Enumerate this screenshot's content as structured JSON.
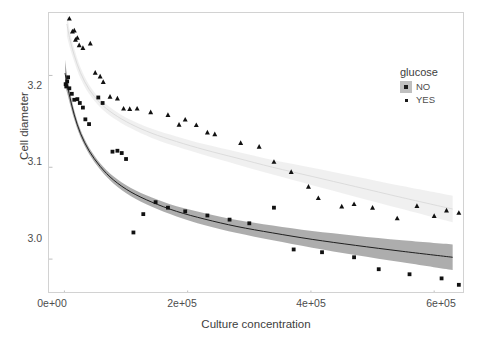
{
  "chart_data": {
    "type": "scatter",
    "title": "",
    "xlabel": "Culture concentration",
    "ylabel": "Cell diameter",
    "xlim": [
      -25000,
      650000
    ],
    "ylim": [
      2.962,
      3.268
    ],
    "xticks": [
      0,
      200000,
      400000,
      600000
    ],
    "xticklabels": [
      "0e+00",
      "2e+05",
      "4e+05",
      "6e+05"
    ],
    "yticks": [
      3.0,
      3.1,
      3.2
    ],
    "yticklabels": [
      "3.0",
      "3.1",
      "3.2"
    ],
    "grid": false,
    "legend": {
      "title": "glucose",
      "position": "right",
      "entries": [
        {
          "label": "NO",
          "marker": "square",
          "color": "#1a1a1a",
          "ribbon": "#a9a9a9"
        },
        {
          "label": "YES",
          "marker": "triangle",
          "color": "#1a1a1a",
          "ribbon": "#ededed"
        }
      ]
    },
    "series": [
      {
        "name": "NO",
        "marker": "square",
        "color": "#111111",
        "line_color": "#1f1f1f",
        "ribbon_color": "#a9a9a9",
        "points": [
          [
            2000,
            3.1905
          ],
          [
            3000,
            3.188
          ],
          [
            4500,
            3.1935
          ],
          [
            6000,
            3.198
          ],
          [
            8000,
            3.186
          ],
          [
            12000,
            3.18
          ],
          [
            16000,
            3.1735
          ],
          [
            21000,
            3.1742
          ],
          [
            25000,
            3.17
          ],
          [
            30000,
            3.165
          ],
          [
            34000,
            3.1522
          ],
          [
            40000,
            3.147
          ],
          [
            55000,
            3.176
          ],
          [
            62000,
            3.17
          ],
          [
            78000,
            3.117
          ],
          [
            86000,
            3.118
          ],
          [
            93000,
            3.1155
          ],
          [
            100000,
            3.109
          ],
          [
            112000,
            3.029
          ],
          [
            128000,
            3.049
          ],
          [
            148000,
            3.062
          ],
          [
            168000,
            3.056
          ],
          [
            196000,
            3.052
          ],
          [
            232000,
            3.0475
          ],
          [
            268000,
            3.043
          ],
          [
            300000,
            3.039
          ],
          [
            340000,
            3.056
          ],
          [
            372000,
            3.0105
          ],
          [
            418000,
            3.0075
          ],
          [
            470000,
            3.002
          ],
          [
            510000,
            2.989
          ],
          [
            560000,
            2.9835
          ],
          [
            612000,
            2.979
          ],
          [
            640000,
            2.972
          ]
        ]
      },
      {
        "name": "YES",
        "marker": "triangle",
        "color": "#111111",
        "line_color": "#d9d9d9",
        "ribbon_color": "#ededed",
        "points": [
          [
            8000,
            3.262
          ],
          [
            13000,
            3.248
          ],
          [
            16000,
            3.249
          ],
          [
            18000,
            3.239
          ],
          [
            21000,
            3.241
          ],
          [
            24000,
            3.233
          ],
          [
            30000,
            3.23
          ],
          [
            42000,
            3.235
          ],
          [
            50000,
            3.203
          ],
          [
            58000,
            3.199
          ],
          [
            63000,
            3.193
          ],
          [
            74000,
            3.177
          ],
          [
            86000,
            3.175
          ],
          [
            96000,
            3.164
          ],
          [
            106000,
            3.1635
          ],
          [
            118000,
            3.164
          ],
          [
            140000,
            3.16
          ],
          [
            168000,
            3.157
          ],
          [
            186000,
            3.1465
          ],
          [
            196000,
            3.152
          ],
          [
            214000,
            3.146
          ],
          [
            232000,
            3.138
          ],
          [
            244000,
            3.136
          ],
          [
            286000,
            3.1265
          ],
          [
            316000,
            3.1225
          ],
          [
            340000,
            3.106
          ],
          [
            368000,
            3.095
          ],
          [
            396000,
            3.079
          ],
          [
            412000,
            3.0665
          ],
          [
            450000,
            3.0575
          ],
          [
            470000,
            3.06
          ],
          [
            500000,
            3.056
          ],
          [
            540000,
            3.0445
          ],
          [
            572000,
            3.058
          ],
          [
            600000,
            3.047
          ],
          [
            620000,
            3.053
          ],
          [
            640000,
            3.0505
          ]
        ]
      }
    ],
    "fits": [
      {
        "name": "NO",
        "x": [
          1000,
          4000,
          9000,
          16000,
          26000,
          40000,
          58000,
          80000,
          108000,
          142000,
          182000,
          228000,
          280000,
          338000,
          402000,
          472000,
          548000,
          630000
        ],
        "y": [
          3.2025,
          3.192,
          3.176,
          3.157,
          3.137,
          3.118,
          3.101,
          3.086,
          3.073,
          3.062,
          3.052,
          3.0435,
          3.0355,
          3.0285,
          3.0215,
          3.015,
          3.0085,
          3.002
        ],
        "y_low": [
          3.188,
          3.182,
          3.169,
          3.152,
          3.133,
          3.1145,
          3.0975,
          3.082,
          3.0685,
          3.057,
          3.0465,
          3.037,
          3.0285,
          3.0205,
          3.0125,
          3.0045,
          2.9965,
          2.988
        ],
        "y_high": [
          3.217,
          3.202,
          3.183,
          3.162,
          3.141,
          3.1215,
          3.1045,
          3.09,
          3.0775,
          3.067,
          3.0575,
          3.05,
          3.0425,
          3.0365,
          3.0305,
          3.0255,
          3.0205,
          3.016
        ]
      },
      {
        "name": "YES",
        "x": [
          4000,
          9000,
          16000,
          26000,
          40000,
          58000,
          80000,
          108000,
          142000,
          182000,
          228000,
          280000,
          338000,
          402000,
          472000,
          548000,
          630000
        ],
        "y": [
          3.256,
          3.239,
          3.222,
          3.203,
          3.185,
          3.17,
          3.158,
          3.147,
          3.137,
          3.128,
          3.119,
          3.11,
          3.1,
          3.09,
          3.079,
          3.067,
          3.0545
        ],
        "y_low": [
          3.243,
          3.23,
          3.215,
          3.197,
          3.18,
          3.1655,
          3.1535,
          3.1425,
          3.132,
          3.1225,
          3.113,
          3.103,
          3.092,
          3.0805,
          3.068,
          3.0545,
          3.04
        ],
        "y_high": [
          3.269,
          3.248,
          3.229,
          3.209,
          3.19,
          3.1745,
          3.1625,
          3.1515,
          3.142,
          3.1335,
          3.125,
          3.117,
          3.108,
          3.0995,
          3.09,
          3.0795,
          3.069
        ]
      }
    ]
  },
  "axes": {
    "ylabel": "Cell diameter",
    "xlabel": "Culture concentration",
    "yticklabels": [
      "3.2",
      "3.1",
      "3.0"
    ],
    "xticklabels": [
      "0e+00",
      "2e+05",
      "4e+05",
      "6e+05"
    ]
  },
  "legend": {
    "title": "glucose",
    "items": [
      {
        "label": "NO"
      },
      {
        "label": "YES"
      }
    ]
  }
}
